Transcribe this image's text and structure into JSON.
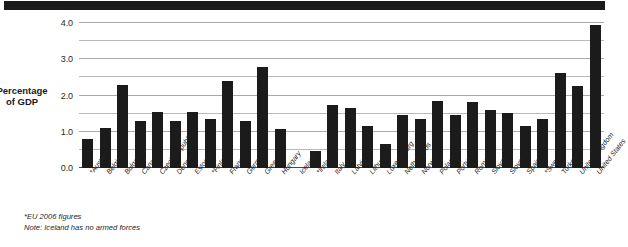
{
  "figure": {
    "banner_present": true,
    "banner_color": "#1b1b1b",
    "bar_color": "#1b1b1b",
    "grid_color": "#b9b9b9"
  },
  "axis": {
    "y_title_line1": "Percentage",
    "y_title_line2": "of GDP",
    "y_tick_labels": [
      "0.0",
      "1.0",
      "2.0",
      "3.0",
      "4.0"
    ]
  },
  "footnotes": [
    "*EU 2006 figures",
    "Note: Iceland has no armed forces"
  ],
  "chart_data": {
    "type": "bar",
    "title": "",
    "xlabel": "",
    "ylabel": "Percentage of GDP",
    "ylim": [
      0.0,
      4.0
    ],
    "yticks": [
      0.0,
      1.0,
      2.0,
      3.0,
      4.0
    ],
    "minor_gridlines": [
      0.5,
      1.5,
      2.5,
      3.5
    ],
    "grid": true,
    "legend": "none",
    "categories": [
      "*Austria",
      "Belgium",
      "Bulgaria",
      "Canada",
      "Czech Republic",
      "Denmark",
      "Estonia",
      "*Finland",
      "France",
      "Germany",
      "Greece",
      "Hungary",
      "Iceland",
      "*Ireland",
      "Italy",
      "Latvia",
      "Lithuania",
      "Luxembourg",
      "Netherlands",
      "Norway",
      "Poland",
      "Portugal",
      "Romania",
      "Slovakia",
      "Slovenia",
      "Spain",
      "*Sweden",
      "Turkey",
      "United Kingdom",
      "United States"
    ],
    "values": [
      0.8,
      1.1,
      2.3,
      1.3,
      1.55,
      1.3,
      1.55,
      1.35,
      2.4,
      1.3,
      2.78,
      1.08,
      0.0,
      0.48,
      1.75,
      1.65,
      1.17,
      0.65,
      1.45,
      1.35,
      1.85,
      1.45,
      1.83,
      1.6,
      1.52,
      1.15,
      1.35,
      2.62,
      2.25,
      3.95
    ],
    "annotations": [
      "*EU 2006 figures",
      "Note: Iceland has no armed forces"
    ]
  }
}
